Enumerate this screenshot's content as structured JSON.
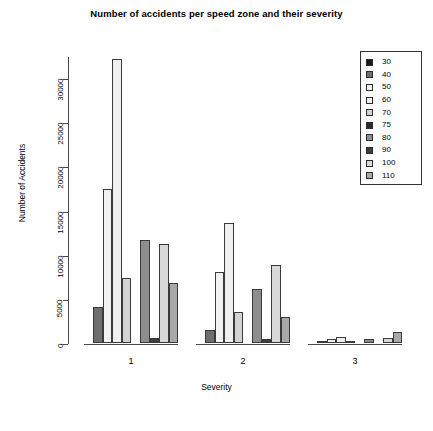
{
  "chart_data": {
    "type": "bar",
    "title": "Number of accidents per speed zone and their severity",
    "xlabel": "Severity",
    "ylabel": "Number of Accidents",
    "categories": [
      "1",
      "2",
      "3"
    ],
    "ylim": [
      0,
      32500
    ],
    "ytick_labels": [
      "0",
      "5000",
      "10000",
      "15000",
      "20000",
      "25000",
      "30000"
    ],
    "ytick_values": [
      0,
      5000,
      10000,
      15000,
      20000,
      25000,
      30000
    ],
    "grid": false,
    "legend_position": "top-right",
    "legend_title": "",
    "series": [
      {
        "name": "30",
        "color": "#1a1a1a",
        "values": [
          0,
          0,
          0
        ]
      },
      {
        "name": "40",
        "color": "#6e6e6e",
        "values": [
          4100,
          1500,
          120
        ]
      },
      {
        "name": "50",
        "color": "#f2f2f2",
        "values": [
          17400,
          8000,
          430
        ]
      },
      {
        "name": "60",
        "color": "#efefef",
        "values": [
          32200,
          13600,
          700
        ]
      },
      {
        "name": "70",
        "color": "#d2d2d2",
        "values": [
          7400,
          3500,
          260
        ]
      },
      {
        "name": "75",
        "color": "#2a2a2a",
        "values": [
          0,
          0,
          0
        ]
      },
      {
        "name": "80",
        "color": "#8d8d8d",
        "values": [
          11700,
          6100,
          480
        ]
      },
      {
        "name": "90",
        "color": "#3c3c3c",
        "values": [
          520,
          400,
          40
        ]
      },
      {
        "name": "100",
        "color": "#d8d8d8",
        "values": [
          11200,
          8800,
          560
        ]
      },
      {
        "name": "110",
        "color": "#a8a8a8",
        "values": [
          6800,
          2900,
          1250
        ]
      }
    ]
  }
}
